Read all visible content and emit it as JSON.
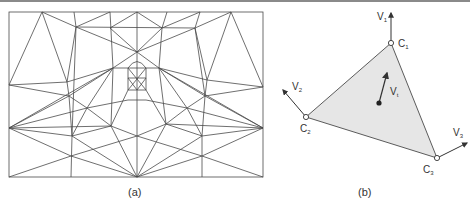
{
  "figure": {
    "panel_a": {
      "caption": "(a)",
      "description": "Triangular mesh over a face-like image region",
      "frame": {
        "x": 9,
        "y": 12,
        "width": 254,
        "height": 165
      }
    },
    "panel_b": {
      "caption": "(b)",
      "description": "Single shaded triangle with corner velocity vectors and interior vector",
      "vertices": [
        {
          "name": "C",
          "sub": "1",
          "label_id": "c1"
        },
        {
          "name": "C",
          "sub": "2",
          "label_id": "c2"
        },
        {
          "name": "C",
          "sub": "3",
          "label_id": "c3"
        }
      ],
      "vectors": [
        {
          "name": "V",
          "sub": "1"
        },
        {
          "name": "V",
          "sub": "2"
        },
        {
          "name": "V",
          "sub": "3"
        },
        {
          "name": "V",
          "sub": "t"
        }
      ]
    }
  },
  "colors": {
    "line": "#4a4a4a",
    "triangle_fill": "#e6e6e6",
    "top_rule": "#8a8a8a"
  }
}
